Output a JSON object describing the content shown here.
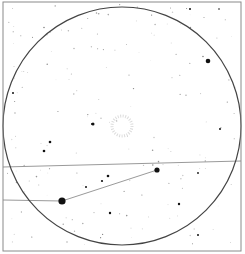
{
  "chart": {
    "type": "finder-chart",
    "background": "#ffffff",
    "frame": {
      "x": 3,
      "y": 2,
      "w": 238,
      "h": 249,
      "color": "#8a8a8a"
    },
    "field_circle": {
      "cx": 122,
      "cy": 126,
      "r": 119,
      "color": "#444444"
    },
    "lines": [
      {
        "x1": 3,
        "y1": 167,
        "x2": 241,
        "y2": 161,
        "color": "#9a9a9a"
      },
      {
        "x1": 3,
        "y1": 200,
        "x2": 62,
        "y2": 201,
        "color": "#9a9a9a"
      },
      {
        "x1": 62,
        "y1": 201,
        "x2": 157,
        "y2": 170,
        "color": "#9a9a9a"
      }
    ],
    "target": {
      "cx": 122,
      "cy": 126,
      "r": 10,
      "color": "#dcdcdc"
    },
    "stars_bright": [
      {
        "x": 62,
        "y": 201,
        "r": 3.6
      },
      {
        "x": 157,
        "y": 170,
        "r": 2.6
      },
      {
        "x": 208,
        "y": 61,
        "r": 2.3
      },
      {
        "x": 93,
        "y": 124,
        "r": 1.5
      },
      {
        "x": 50,
        "y": 142,
        "r": 1.3
      },
      {
        "x": 44,
        "y": 151,
        "r": 1.3
      },
      {
        "x": 108,
        "y": 176,
        "r": 1.3
      },
      {
        "x": 102,
        "y": 181,
        "r": 1.1
      },
      {
        "x": 86,
        "y": 187,
        "r": 1.0
      },
      {
        "x": 110,
        "y": 213,
        "r": 1.2
      },
      {
        "x": 179,
        "y": 204,
        "r": 1.2
      },
      {
        "x": 220,
        "y": 129,
        "r": 1.0
      },
      {
        "x": 190,
        "y": 9,
        "r": 1.0
      },
      {
        "x": 198,
        "y": 235,
        "r": 1.0
      },
      {
        "x": 13,
        "y": 93,
        "r": 1.0
      },
      {
        "x": 92,
        "y": 124,
        "r": 1.0
      },
      {
        "x": 198,
        "y": 173,
        "r": 0.9
      },
      {
        "x": 219,
        "y": 9,
        "r": 0.8
      }
    ],
    "stars_faint_seed": 17,
    "stars_faint_count": 170
  }
}
